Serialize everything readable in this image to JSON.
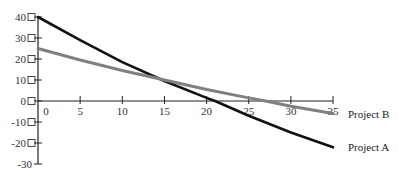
{
  "chart_data": {
    "type": "line",
    "title": "",
    "xlabel": "",
    "ylabel": "",
    "xlim": [
      0,
      35
    ],
    "ylim": [
      -30,
      40
    ],
    "x_ticks": [
      0,
      5,
      10,
      15,
      20,
      25,
      30,
      35
    ],
    "y_ticks": [
      40,
      30,
      20,
      10,
      0,
      -10,
      -20,
      -30
    ],
    "grid": false,
    "legend_position": "right, inline labels at line ends",
    "series": [
      {
        "name": "Project A",
        "color": "#111111",
        "x": [
          0,
          5,
          10,
          15,
          20,
          21,
          25,
          30,
          35
        ],
        "values": [
          40,
          29,
          18.5,
          9.5,
          1.5,
          0,
          -7,
          -15,
          -22
        ]
      },
      {
        "name": "Project B",
        "color": "#808080",
        "x": [
          0,
          5,
          10,
          15,
          20,
          25,
          27,
          30,
          35
        ],
        "values": [
          25,
          19.5,
          14.5,
          10,
          5.5,
          1.5,
          0,
          -2.5,
          -6
        ]
      }
    ]
  }
}
